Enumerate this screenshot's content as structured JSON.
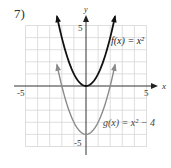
{
  "problem": {
    "number": "7)"
  },
  "axes": {
    "x_label": "x",
    "y_label": "y",
    "x_ticks": [
      "-5",
      "5"
    ],
    "y_ticks": [
      "5",
      "-5"
    ]
  },
  "curves": {
    "f_label": "f(x) = x²",
    "g_label": "g(x) = x² − 4"
  },
  "colors": {
    "f": "#111111",
    "g": "#8a8a8a",
    "grid": "#d6d6d6",
    "axis": "#333333"
  },
  "chart_data": {
    "type": "line",
    "title": "",
    "xlabel": "x",
    "ylabel": "y",
    "xlim": [
      -5,
      5
    ],
    "ylim": [
      -5,
      5
    ],
    "grid": true,
    "series": [
      {
        "name": "f(x) = x^2",
        "expression": "x^2",
        "x_range": [
          -2.4,
          2.4
        ],
        "vertex": [
          0,
          0
        ],
        "x": [
          -2.4,
          -2,
          -1,
          0,
          1,
          2,
          2.4
        ],
        "y": [
          5.76,
          4,
          1,
          0,
          1,
          4,
          5.76
        ]
      },
      {
        "name": "g(x) = x^2 - 4",
        "expression": "x^2 - 4",
        "x_range": [
          -2.4,
          2.4
        ],
        "vertex": [
          0,
          -4
        ],
        "x": [
          -2.4,
          -2,
          -1,
          0,
          1,
          2,
          2.4
        ],
        "y": [
          1.76,
          0,
          -3,
          -4,
          -3,
          0,
          1.76
        ]
      }
    ],
    "annotations": [
      "f(x) = x^2",
      "g(x) = x^2 - 4"
    ]
  }
}
